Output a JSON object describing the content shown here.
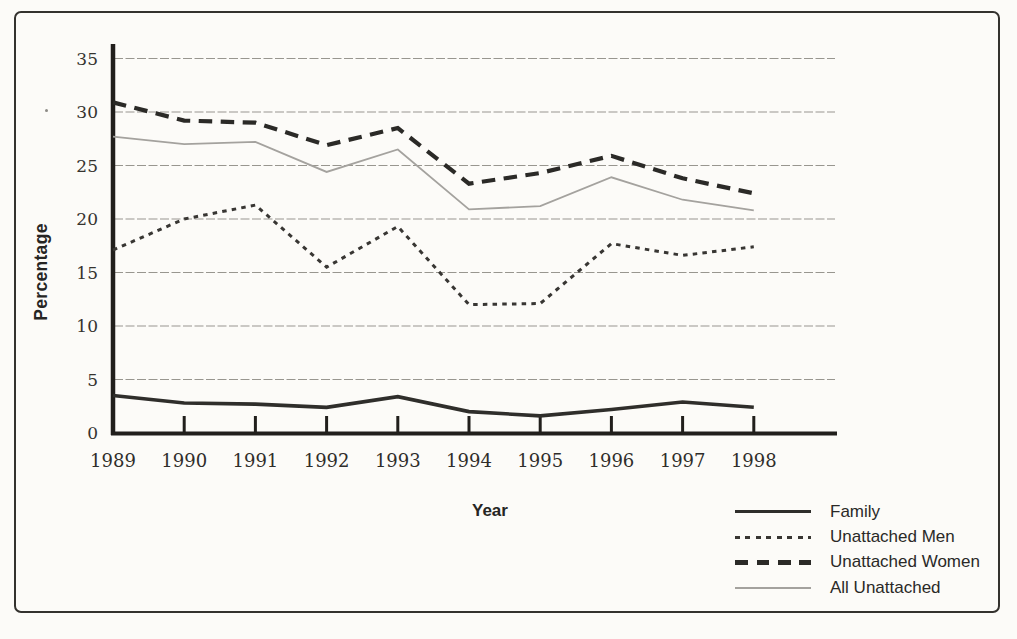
{
  "chart_data": {
    "type": "line",
    "title": "",
    "xlabel": "Year",
    "ylabel": "Percentage",
    "x_tick_labels": [
      "1989",
      "1990",
      "1991",
      "1992",
      "1993",
      "1994",
      "1995",
      "1996",
      "1997",
      "1998"
    ],
    "y_ticks": [
      0,
      5,
      10,
      15,
      20,
      25,
      30,
      35
    ],
    "ylim": [
      0,
      35
    ],
    "grid": "horizontal",
    "legend_position": "bottom-right",
    "ink_color": "#211f1c",
    "grid_color": "#98968f",
    "series": [
      {
        "name": "Family",
        "style": "solid-thick",
        "color": "#2f2e2b",
        "values": [
          3.5,
          2.8,
          2.7,
          2.4,
          3.4,
          2.0,
          1.6,
          2.2,
          2.9,
          2.4
        ]
      },
      {
        "name": "Unattached Men",
        "style": "dotted",
        "color": "#383633",
        "values": [
          17.1,
          20.0,
          21.3,
          15.5,
          19.3,
          12.0,
          12.1,
          17.7,
          16.6,
          17.4
        ]
      },
      {
        "name": "Unattached Women",
        "style": "dashed",
        "color": "#2b2a27",
        "values": [
          30.9,
          29.2,
          29.0,
          26.9,
          28.5,
          23.3,
          24.3,
          25.9,
          23.8,
          22.4
        ]
      },
      {
        "name": "All Unattached",
        "style": "solid-thin",
        "color": "#a4a29e",
        "values": [
          27.7,
          27.0,
          27.2,
          24.4,
          26.5,
          20.9,
          21.2,
          23.9,
          21.8,
          20.8
        ]
      }
    ]
  }
}
